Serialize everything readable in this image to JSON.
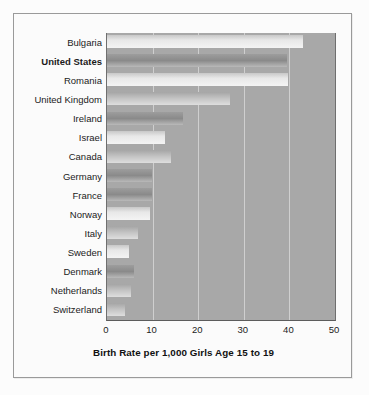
{
  "chart_data": {
    "type": "bar",
    "orientation": "horizontal",
    "title": "",
    "xlabel": "Birth Rate per 1,000 Girls Age 15 to 19",
    "ylabel": "",
    "xlim": [
      0,
      50
    ],
    "xticks": [
      "0",
      "10",
      "20",
      "30",
      "40",
      "50"
    ],
    "grid": true,
    "legend": "none",
    "highlight_category": "United States",
    "categories": [
      "Bulgaria",
      "United States",
      "Romania",
      "United Kingdom",
      "Ireland",
      "Israel",
      "Canada",
      "Germany",
      "France",
      "Norway",
      "Italy",
      "Sweden",
      "Denmark",
      "Netherlands",
      "Switzerland"
    ],
    "values": [
      43,
      39.5,
      39.7,
      27,
      16.7,
      12.7,
      14,
      9.9,
      9.9,
      9.4,
      6.8,
      4.8,
      6,
      5.2,
      4
    ]
  },
  "bars": [
    {
      "label": "Bulgaria",
      "value": 43,
      "tone": "tone-light",
      "highlight": false
    },
    {
      "label": "United States",
      "value": 39.5,
      "tone": "tone-dark",
      "highlight": true
    },
    {
      "label": "Romania",
      "value": 39.7,
      "tone": "tone-light",
      "highlight": false
    },
    {
      "label": "United Kingdom",
      "value": 27,
      "tone": "tone-mid",
      "highlight": false
    },
    {
      "label": "Ireland",
      "value": 16.7,
      "tone": "tone-dark",
      "highlight": false
    },
    {
      "label": "Israel",
      "value": 12.7,
      "tone": "tone-light",
      "highlight": false
    },
    {
      "label": "Canada",
      "value": 14,
      "tone": "tone-mid",
      "highlight": false
    },
    {
      "label": "Germany",
      "value": 9.9,
      "tone": "tone-dark",
      "highlight": false
    },
    {
      "label": "France",
      "value": 9.9,
      "tone": "tone-dark",
      "highlight": false
    },
    {
      "label": "Norway",
      "value": 9.4,
      "tone": "tone-light",
      "highlight": false
    },
    {
      "label": "Italy",
      "value": 6.8,
      "tone": "tone-mid",
      "highlight": false
    },
    {
      "label": "Sweden",
      "value": 4.8,
      "tone": "tone-light",
      "highlight": false
    },
    {
      "label": "Denmark",
      "value": 6,
      "tone": "tone-dark",
      "highlight": false
    },
    {
      "label": "Netherlands",
      "value": 5.2,
      "tone": "tone-mid",
      "highlight": false
    },
    {
      "label": "Switzerland",
      "value": 4,
      "tone": "tone-mid",
      "highlight": false
    }
  ],
  "axis": {
    "title": "Birth Rate per 1,000 Girls Age 15 to 19",
    "ticks": [
      {
        "label": "0",
        "value": 0
      },
      {
        "label": "10",
        "value": 10
      },
      {
        "label": "20",
        "value": 20
      },
      {
        "label": "30",
        "value": 30
      },
      {
        "label": "40",
        "value": 40
      },
      {
        "label": "50",
        "value": 50
      }
    ]
  },
  "colors": {
    "plot_background": "#a8a8a8",
    "gridline": "#cfcfcf",
    "frame": "#9a9a9a",
    "page_background": "#fcfcfc",
    "text": "#1b1b1b"
  }
}
